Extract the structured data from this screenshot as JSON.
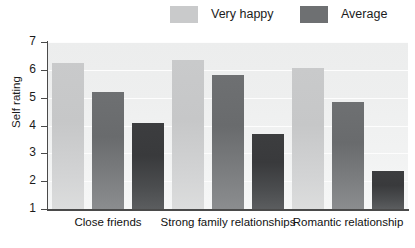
{
  "chart_data": {
    "type": "bar",
    "title": "",
    "subtitle": "",
    "xlabel": "",
    "ylabel": "Self rating",
    "categories": [
      "Close friends",
      "Strong family relationships",
      "Romantic relationship"
    ],
    "series": [
      {
        "name": "Very happy",
        "color": "#c9cacb",
        "values": [
          6.25,
          6.35,
          6.05
        ]
      },
      {
        "name": "Average",
        "color": "#6e7072",
        "values": [
          5.2,
          5.8,
          4.85
        ]
      },
      {
        "name": "",
        "color": "#3c3d3f",
        "values": [
          4.1,
          3.7,
          2.35
        ]
      }
    ],
    "ylim": [
      1,
      7
    ],
    "yticks": [
      1,
      2,
      3,
      4,
      5,
      6,
      7
    ],
    "ytick_labels": [
      "1",
      "2",
      "3",
      "4",
      "5",
      "6",
      "7"
    ],
    "grid": true,
    "grid_axis": "y",
    "legend_position": "top",
    "legend_entries": [
      "Very happy",
      "Average"
    ]
  }
}
